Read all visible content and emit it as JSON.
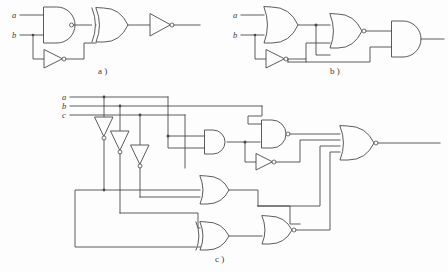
{
  "figure": {
    "background_color": "#fdfdfd",
    "line_color": "#4a4a4a",
    "panels": [
      {
        "id": "a",
        "caption": "a )",
        "inputs": [
          {
            "label": "a"
          },
          {
            "label": "b"
          }
        ],
        "gates": [
          {
            "name": "nand-gate",
            "type": "NAND"
          },
          {
            "name": "not-gate",
            "type": "NOT"
          },
          {
            "name": "xor-gate",
            "type": "XOR"
          },
          {
            "name": "output-not-gate",
            "type": "NOT"
          }
        ]
      },
      {
        "id": "b",
        "caption": "b )",
        "inputs": [
          {
            "label": "a"
          },
          {
            "label": "b"
          }
        ],
        "gates": [
          {
            "name": "or-gate",
            "type": "OR"
          },
          {
            "name": "not-gate",
            "type": "NOT"
          },
          {
            "name": "nor-gate",
            "type": "NOR"
          },
          {
            "name": "output-and-gate",
            "type": "AND"
          }
        ]
      },
      {
        "id": "c",
        "caption": "c )",
        "inputs": [
          {
            "label": "a"
          },
          {
            "label": "b"
          },
          {
            "label": "c"
          }
        ],
        "gates": [
          {
            "name": "not-gate-a",
            "type": "NOT"
          },
          {
            "name": "not-gate-b",
            "type": "NOT"
          },
          {
            "name": "not-gate-c",
            "type": "NOT"
          },
          {
            "name": "and-gate-1",
            "type": "AND"
          },
          {
            "name": "nand-gate-1",
            "type": "NAND"
          },
          {
            "name": "not-gate-mid",
            "type": "NOT"
          },
          {
            "name": "or-gate-1",
            "type": "OR"
          },
          {
            "name": "xor-gate-1",
            "type": "XOR"
          },
          {
            "name": "nor-gate-1",
            "type": "NOR"
          },
          {
            "name": "output-nor-gate",
            "type": "NOR"
          }
        ]
      }
    ]
  }
}
